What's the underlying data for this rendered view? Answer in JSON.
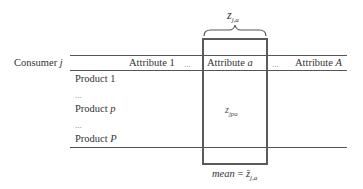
{
  "diagram": {
    "top_label": {
      "base": "z",
      "sub": "j,a"
    },
    "row_header": {
      "text": "Consumer",
      "var": "j"
    },
    "columns": [
      {
        "text": "Attribute",
        "var": "1",
        "var_italic": false
      },
      {
        "text": "...",
        "var": "",
        "var_italic": false
      },
      {
        "text": "Attribute",
        "var": "a",
        "var_italic": true
      },
      {
        "text": "...",
        "var": "",
        "var_italic": false
      },
      {
        "text": "Attribute",
        "var": "A",
        "var_italic": true
      }
    ],
    "rows": [
      {
        "text": "Product",
        "var": "1",
        "var_italic": false
      },
      {
        "text": "...",
        "var": "",
        "var_italic": false
      },
      {
        "text": "Product",
        "var": "p",
        "var_italic": true
      },
      {
        "text": "...",
        "var": "",
        "var_italic": false
      },
      {
        "text": "Product",
        "var": "P",
        "var_italic": true
      }
    ],
    "cell_label": {
      "base": "z",
      "sub": "jpa"
    },
    "bottom_label": {
      "prefix": "mean",
      "equals": "=",
      "base": "z̄",
      "sub": "j,a"
    },
    "colors": {
      "lines": "#555555",
      "box": "#5a5a5a",
      "text": "#333333"
    }
  }
}
